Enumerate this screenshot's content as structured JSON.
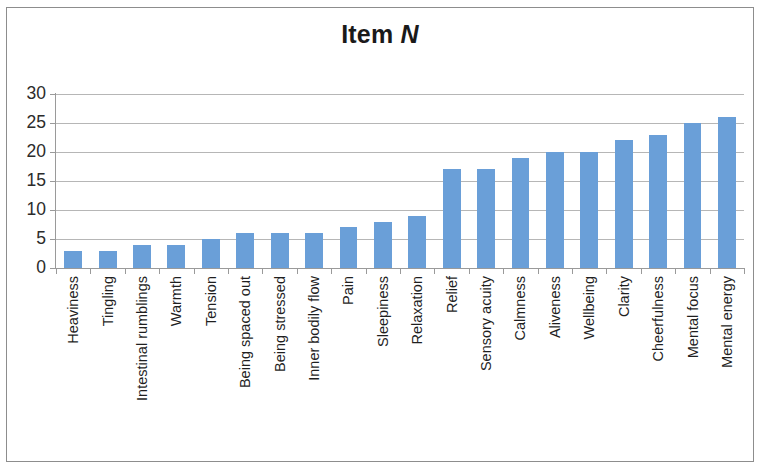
{
  "figure": {
    "width": 760,
    "height": 473,
    "background": "#ffffff",
    "frame_color": "#8d8d8d"
  },
  "title": {
    "main": "Item ",
    "emphasis": "N",
    "full": "Item N"
  },
  "colors": {
    "bar": "#6a9fd8",
    "gridline": "#b6b6b6",
    "axis": "#9a9a9a",
    "text": "#1f1f1f"
  },
  "chart_data": {
    "type": "bar",
    "title": "Item N",
    "xlabel": "",
    "ylabel": "",
    "ylim": [
      0,
      30
    ],
    "yticks": [
      0,
      5,
      10,
      15,
      20,
      25,
      30
    ],
    "ytick_labels": [
      "0",
      "5",
      "10",
      "15",
      "20",
      "25",
      "30"
    ],
    "grid": true,
    "legend": false,
    "orientation": "vertical",
    "categories": [
      "Heaviness",
      "Tingling",
      "Intestinal rumblings",
      "Warmth",
      "Tension",
      "Being spaced out",
      "Being stressed",
      "Inner bodily flow",
      "Pain",
      "Sleepiness",
      "Relaxation",
      "Relief",
      "Sensory acuity",
      "Calmness",
      "Aliveness",
      "Wellbeing",
      "Clarity",
      "Cheerfulness",
      "Mental focus",
      "Mental energy"
    ],
    "values": [
      3,
      3,
      4,
      4,
      5,
      6,
      6,
      6,
      7,
      8,
      9,
      17,
      17,
      19,
      20,
      20,
      22,
      23,
      25,
      26
    ]
  }
}
